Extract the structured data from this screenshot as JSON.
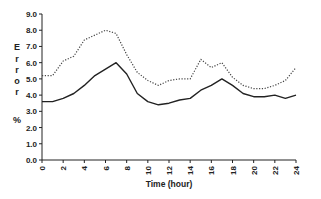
{
  "chart_data": {
    "type": "line",
    "title": "",
    "xlabel": "Time (hour)",
    "ylabel": "Error %",
    "x": [
      0,
      1,
      2,
      3,
      4,
      5,
      6,
      7,
      8,
      9,
      10,
      11,
      12,
      13,
      14,
      15,
      16,
      17,
      18,
      19,
      20,
      21,
      22,
      23,
      24
    ],
    "xticks": [
      "0",
      "2",
      "4",
      "6",
      "8",
      "10",
      "12",
      "14",
      "16",
      "18",
      "20",
      "22",
      "24"
    ],
    "yticks": [
      "0.0",
      "1.0",
      "2.0",
      "3.0",
      "4.0",
      "5.0",
      "6.0",
      "7.0",
      "8.0",
      "9.0"
    ],
    "xlim": [
      0,
      24
    ],
    "ylim": [
      0,
      9
    ],
    "grid": false,
    "legend": null,
    "series": [
      {
        "name": "solid",
        "style": "solid",
        "color": "#222222",
        "values": [
          3.6,
          3.6,
          3.8,
          4.1,
          4.6,
          5.2,
          5.6,
          6.0,
          5.3,
          4.1,
          3.6,
          3.4,
          3.5,
          3.7,
          3.8,
          4.3,
          4.6,
          5.0,
          4.6,
          4.1,
          3.9,
          3.9,
          4.0,
          3.8,
          4.0
        ]
      },
      {
        "name": "dotted",
        "style": "dotted",
        "color": "#444444",
        "values": [
          5.2,
          5.2,
          6.1,
          6.4,
          7.4,
          7.7,
          8.0,
          7.8,
          6.5,
          5.4,
          4.9,
          4.6,
          4.9,
          5.0,
          5.0,
          6.2,
          5.7,
          6.0,
          5.1,
          4.6,
          4.4,
          4.4,
          4.6,
          4.9,
          5.7
        ]
      }
    ]
  }
}
